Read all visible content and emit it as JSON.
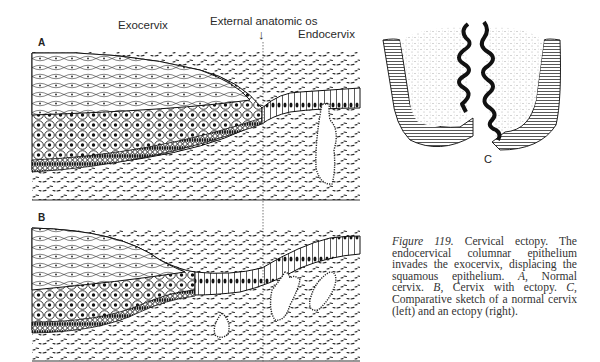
{
  "figure": {
    "labels": {
      "exocervix": "Exocervix",
      "external_os": "External anatomic os",
      "arrow": "↓",
      "endocervix": "Endocervix"
    },
    "panels": {
      "a": "A",
      "b": "B",
      "c": "C"
    },
    "caption": {
      "figure_label": "Figure 119.",
      "text": " Cervical ectopy. The endocervical columnar epithelium invades the exocervix, displacing the squamous epithelium. ",
      "a_label": "A,",
      "a_text": " Normal cervix. ",
      "b_label": "B,",
      "b_text": " Cervix with ectopy. ",
      "c_label": "C,",
      "c_text": " Comparative sketch of a normal cervix (left) and an ectopy (right)."
    }
  }
}
